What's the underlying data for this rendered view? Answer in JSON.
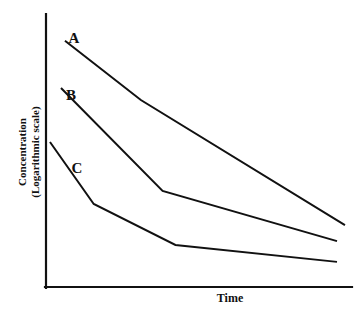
{
  "chart_data": {
    "type": "line",
    "title": "",
    "subtitle": "",
    "xlabel": "Time",
    "ylabel": "Concentration\n(Logarithmic scale)",
    "ylabel_lines": [
      "Concentration",
      "(Logarithmic scale)"
    ],
    "y_scale": "logarithmic",
    "x_scale": "linear",
    "grid": false,
    "legend": "inline-labels",
    "axis_ticks": "none",
    "tick_labels": {
      "x": [],
      "y": []
    },
    "xlim": [
      0,
      100
    ],
    "ylim": [
      0,
      100
    ],
    "series": [
      {
        "name": "A",
        "label": "A",
        "color": "#111111",
        "points": [
          {
            "x": 6.2,
            "y": 90.2
          },
          {
            "x": 31.0,
            "y": 68.5
          },
          {
            "x": 97.7,
            "y": 22.7
          }
        ]
      },
      {
        "name": "B",
        "label": "B",
        "color": "#111111",
        "points": [
          {
            "x": 4.9,
            "y": 72.9
          },
          {
            "x": 38.1,
            "y": 35.2
          },
          {
            "x": 95.1,
            "y": 16.8
          }
        ]
      },
      {
        "name": "C",
        "label": "C",
        "color": "#111111",
        "points": [
          {
            "x": 1.3,
            "y": 53.1
          },
          {
            "x": 15.6,
            "y": 30.4
          },
          {
            "x": 42.3,
            "y": 15.4
          },
          {
            "x": 95.1,
            "y": 9.2
          }
        ]
      }
    ]
  },
  "axes": {
    "x_axis_name": "time-axis",
    "y_axis_name": "concentration-axis"
  },
  "labels": {
    "series_a": "A",
    "series_b": "B",
    "series_c": "C",
    "x_axis_title": "Time",
    "y_axis_title_line1": "Concentration",
    "y_axis_title_line2": "(Logarithmic scale)"
  }
}
